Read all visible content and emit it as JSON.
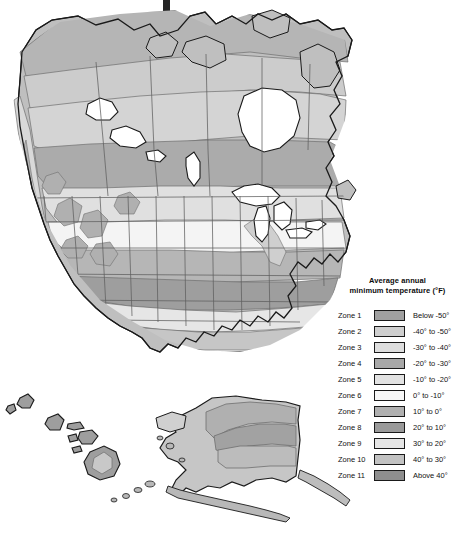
{
  "figure": {
    "kind": "choropleth-map",
    "region": "North America",
    "insets": [
      "Hawaii",
      "Alaska"
    ],
    "title_clipped": true
  },
  "legend": {
    "title_line1": "Average annual",
    "title_line2": "minimum temperature (°F)",
    "rows": [
      {
        "zone": "Zone 1",
        "range": "Below -50°",
        "color": "#a0a0a0"
      },
      {
        "zone": "Zone 2",
        "range": "-40° to -50°",
        "color": "#cfcfcf"
      },
      {
        "zone": "Zone 3",
        "range": "-30° to -40°",
        "color": "#dedede"
      },
      {
        "zone": "Zone 4",
        "range": "-20° to -30°",
        "color": "#a8a8a8"
      },
      {
        "zone": "Zone 5",
        "range": "-10° to -20°",
        "color": "#e2e2e2"
      },
      {
        "zone": "Zone 6",
        "range": "0° to -10°",
        "color": "#f7f7f7"
      },
      {
        "zone": "Zone 7",
        "range": "10° to 0°",
        "color": "#b0b0b0"
      },
      {
        "zone": "Zone 8",
        "range": "20° to 10°",
        "color": "#9a9a9a"
      },
      {
        "zone": "Zone 9",
        "range": "30° to 20°",
        "color": "#e6e6e6"
      },
      {
        "zone": "Zone 10",
        "range": "40° to 30°",
        "color": "#c2c2c2"
      },
      {
        "zone": "Zone 11",
        "range": "Above 40°",
        "color": "#8e8e8e"
      }
    ]
  },
  "map_colors": {
    "ocean": "#ffffff",
    "outline": "#1a1a1a",
    "state_border": "#5a5a5a",
    "lake": "#ffffff",
    "zone_1": "#a0a0a0",
    "zone_2": "#cfcfcf",
    "zone_3": "#dedede",
    "zone_4": "#a8a8a8",
    "zone_5": "#e2e2e2",
    "zone_6": "#f7f7f7",
    "zone_7": "#b0b0b0",
    "zone_8": "#9a9a9a",
    "zone_9": "#e6e6e6",
    "zone_10": "#c2c2c2",
    "zone_11": "#8e8e8e"
  }
}
